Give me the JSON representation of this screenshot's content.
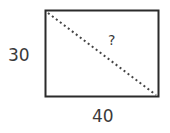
{
  "diagram": {
    "shape": "rectangle",
    "side_label": "30",
    "bottom_label": "40",
    "diagonal_label": "?",
    "stroke_color": "#2b2b2b",
    "diagonal_color": "#444444",
    "text_color": "#3a3a3a"
  }
}
